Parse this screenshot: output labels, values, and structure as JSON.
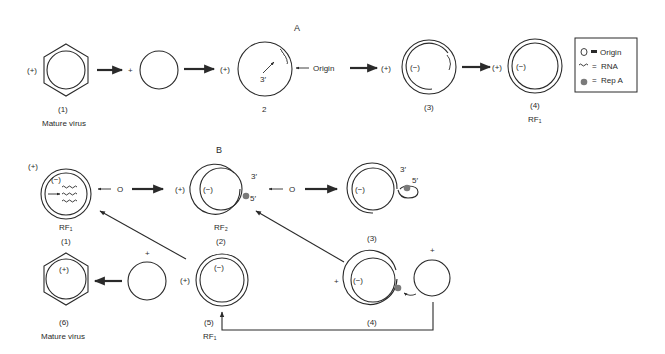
{
  "panel_a": {
    "section_label": "A",
    "steps": [
      {
        "id": "a1",
        "number": "(1)",
        "caption": "Mature virus",
        "strand": "(+)"
      },
      {
        "id": "a1b",
        "strand": "+"
      },
      {
        "id": "a2",
        "number": "2",
        "strand": "(+)",
        "end_label": "3′",
        "pointer_label": "Origin"
      },
      {
        "id": "a3",
        "number": "(3)",
        "strand_outer": "(+)",
        "strand_inner": "(−)"
      },
      {
        "id": "a4",
        "number": "(4)",
        "caption": "RF₁",
        "strand_outer": "(+)",
        "strand_inner": "(−)"
      }
    ]
  },
  "legend": {
    "items": [
      {
        "symbol": "O",
        "connector": "=",
        "label": "Origin"
      },
      {
        "symbol": "wavy-line",
        "connector": "=",
        "label": "RNA"
      },
      {
        "symbol": "gray-dot",
        "connector": "=",
        "label": "Rep A"
      }
    ]
  },
  "panel_b": {
    "section_label": "B",
    "steps": [
      {
        "id": "b1",
        "number": "(1)",
        "caption": "RF₁",
        "strand_outer": "(+)",
        "strand_inner": "(−)",
        "pointer_label": "O"
      },
      {
        "id": "b2",
        "number": "(2)",
        "caption": "RF₂",
        "strand_outer": "(+)",
        "strand_inner": "(−)",
        "end3": "3′",
        "end5": "5′",
        "pointer_label": "O"
      },
      {
        "id": "b3",
        "number": "(3)",
        "strand_inner": "(−)",
        "end3": "3′",
        "end5": "5′"
      },
      {
        "id": "b4",
        "number": "(4)",
        "strand_outer": "+",
        "strand_inner": "(−)",
        "free_strand": "+"
      },
      {
        "id": "b5",
        "number": "(5)",
        "caption": "RF₁",
        "strand_outer": "(+)",
        "strand_inner": "(−)"
      },
      {
        "id": "b5b",
        "strand": "+"
      },
      {
        "id": "b6",
        "number": "(6)",
        "caption": "Mature virus",
        "strand": "(+)"
      }
    ]
  }
}
